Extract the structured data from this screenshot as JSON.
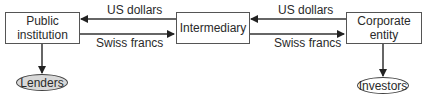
{
  "nodes": {
    "public_institution": {
      "label_line1": "Public",
      "label_line2": "institution"
    },
    "intermediary": {
      "label": "Intermediary"
    },
    "corporate_entity": {
      "label_line1": "Corporate",
      "label_line2": "entity"
    },
    "lenders": {
      "label": "Lenders",
      "fill": "#d9d9d9"
    },
    "investors": {
      "label": "Investors",
      "fill": "#ffffff"
    }
  },
  "edges": {
    "left_top": {
      "label": "US dollars",
      "from": "Intermediary",
      "to": "Public institution"
    },
    "left_bottom": {
      "label": "Swiss francs",
      "from": "Public institution",
      "to": "Intermediary"
    },
    "right_top": {
      "label": "US dollars",
      "from": "Corporate entity",
      "to": "Intermediary"
    },
    "right_bottom": {
      "label": "Swiss francs",
      "from": "Intermediary",
      "to": "Corporate entity"
    },
    "down_left": {
      "from": "Public institution",
      "to": "Lenders"
    },
    "down_right": {
      "from": "Corporate entity",
      "to": "Investors"
    }
  },
  "colors": {
    "line": "#333333",
    "box_border": "#555555"
  }
}
